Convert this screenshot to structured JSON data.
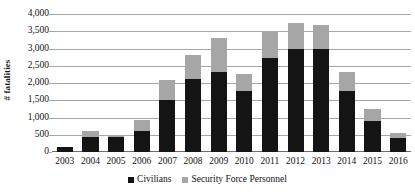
{
  "chart_data": {
    "type": "bar",
    "subtype": "stacked-vertical",
    "title": "",
    "subtitle": "",
    "xlabel": "",
    "ylabel": "# fatalities",
    "categories": [
      "2003",
      "2004",
      "2005",
      "2006",
      "2007",
      "2008",
      "2009",
      "2010",
      "2011",
      "2012",
      "2013",
      "2014",
      "2015",
      "2016"
    ],
    "series": [
      {
        "name": "Civilians",
        "color": "#141414",
        "values": [
          140,
          440,
          430,
          600,
          1510,
          2130,
          2310,
          1780,
          2730,
          3000,
          2990,
          1770,
          910,
          410
        ]
      },
      {
        "name": "Security Force Personnel",
        "color": "#a6a6a6",
        "values": [
          10,
          170,
          20,
          330,
          590,
          670,
          990,
          480,
          770,
          740,
          680,
          550,
          350,
          150
        ]
      }
    ],
    "totals": [
      150,
      610,
      450,
      930,
      2100,
      2800,
      3300,
      2260,
      3500,
      3740,
      3670,
      2320,
      1260,
      560
    ],
    "ylim": [
      0,
      4000
    ],
    "y_ticks": [
      0,
      500,
      1000,
      1500,
      2000,
      2500,
      3000,
      3500,
      4000
    ],
    "y_tick_labels": [
      "0",
      "500",
      "1,000",
      "1,500",
      "2,000",
      "2,500",
      "3,000",
      "3,500",
      "4,000"
    ],
    "grid": true,
    "grid_axis": "y",
    "legend_position": "bottom",
    "legend_entries": [
      "Civilians",
      "Security Force Personnel"
    ]
  },
  "axes": {
    "y_title": "# fatalities"
  },
  "colors": {
    "primary_series": "#141414",
    "secondary_series": "#a6a6a6",
    "gridline": "#a6a6a6",
    "baseline": "#6e6e6e",
    "background": "#ffffff",
    "text": "#111111"
  }
}
